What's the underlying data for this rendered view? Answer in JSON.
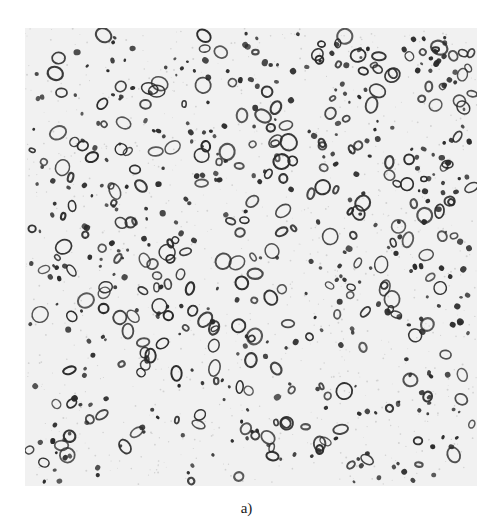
{
  "figure": {
    "label": "a)",
    "kind": "optical micrograph",
    "background_color": "#f1f1f1",
    "particle_color": "#2a2a2a",
    "region": {
      "x": 25,
      "y": 28,
      "width": 452,
      "height": 458
    }
  },
  "header_fragment": {
    "text": "",
    "note": "cut-off, illegible line of text at top edge"
  }
}
